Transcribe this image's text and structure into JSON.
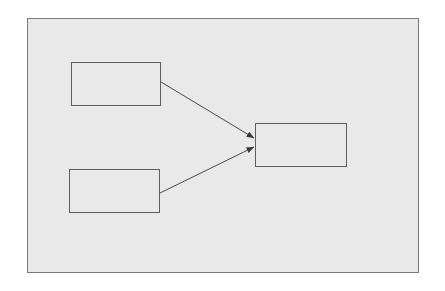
{
  "diagram": {
    "type": "flow",
    "frame": {
      "x": 27,
      "y": 18,
      "width": 392,
      "height": 255,
      "fill": "#e9e9e9",
      "stroke": "#7a7a7a"
    },
    "nodes": [
      {
        "id": "source-top",
        "label": "",
        "x": 71,
        "y": 62,
        "width": 90,
        "height": 44
      },
      {
        "id": "source-bottom",
        "label": "",
        "x": 69,
        "y": 169,
        "width": 91,
        "height": 44
      },
      {
        "id": "target",
        "label": "",
        "x": 255,
        "y": 123,
        "width": 92,
        "height": 44
      }
    ],
    "edges": [
      {
        "from": "source-top",
        "to": "target",
        "x1": 161,
        "y1": 82,
        "x2": 254,
        "y2": 138
      },
      {
        "from": "source-bottom",
        "to": "target",
        "x1": 160,
        "y1": 193,
        "x2": 254,
        "y2": 147
      }
    ],
    "colors": {
      "node_stroke": "#5e5e5e",
      "edge_stroke": "#4a4a4a"
    }
  }
}
